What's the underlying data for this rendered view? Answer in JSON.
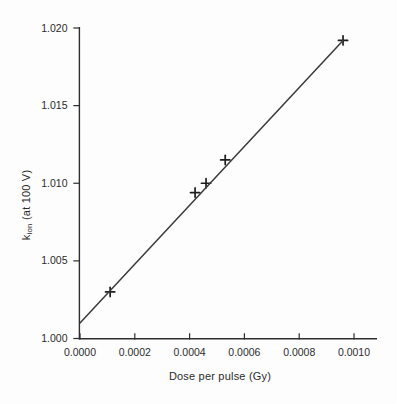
{
  "chart_data": {
    "type": "scatter",
    "title": "",
    "xlabel": "Dose per pulse (Gy)",
    "ylabel": "k_ion (at 100 V)",
    "ylabel_parts": {
      "base": "k",
      "sub": "ion",
      "rest": " (at 100 V)"
    },
    "xlim": [
      0.0,
      0.00109
    ],
    "ylim": [
      1.0,
      1.02
    ],
    "x_ticks": [
      0.0,
      0.0002,
      0.0004,
      0.0006,
      0.0008,
      0.001
    ],
    "x_tick_labels": [
      "0.0000",
      "0.0002",
      "0.0004",
      "0.0006",
      "0.0008",
      "0.0010"
    ],
    "y_ticks": [
      1.0,
      1.005,
      1.01,
      1.015,
      1.02
    ],
    "y_tick_labels": [
      "1.000",
      "1.005",
      "1.010",
      "1.015",
      "1.020"
    ],
    "grid": false,
    "legend": false,
    "series": [
      {
        "name": "measured-points",
        "type": "scatter",
        "marker": "plus",
        "points": [
          [
            0.00011,
            1.003
          ],
          [
            0.00042,
            1.0094
          ],
          [
            0.00046,
            1.01
          ],
          [
            0.00053,
            1.0115
          ],
          [
            0.00096,
            1.0192
          ]
        ]
      },
      {
        "name": "linear-fit",
        "type": "line",
        "points": [
          [
            0.0,
            1.001
          ],
          [
            0.00096,
            1.0192
          ]
        ]
      }
    ],
    "colors": {
      "axis": "#2e2e2e",
      "tick_text": "#2b2b2b",
      "marker": "#1e1e1e",
      "fit_line": "#3a3a3a",
      "background": "#fdfdfd"
    }
  }
}
